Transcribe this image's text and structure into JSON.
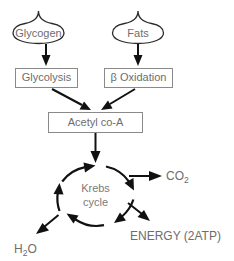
{
  "diagram": {
    "colors": {
      "stroke_dark": "#111111",
      "stroke_blob": "#2b2b2b",
      "box_outline": "#8a8a8a",
      "text_gray": "#6d6d6d",
      "background": "#ffffff"
    },
    "inputs": [
      {
        "id": "glycogen",
        "label": "Glycogen",
        "shape": "flame-blob"
      },
      {
        "id": "fats",
        "label": "Fats",
        "shape": "flame-blob"
      }
    ],
    "processes": [
      {
        "id": "glycolysis",
        "label": "Glycolysis",
        "shape": "rectangle"
      },
      {
        "id": "beta-oxidation",
        "label": "β Oxidation",
        "shape": "rectangle"
      },
      {
        "id": "acetyl-coa",
        "label": "Acetyl co-A",
        "shape": "rectangle"
      }
    ],
    "cycle": {
      "id": "krebs-cycle",
      "label_line1": "Krebs",
      "label_line2": "cycle",
      "shape": "dashed-circular-arrows",
      "segments": 4,
      "direction": "clockwise"
    },
    "outputs": [
      {
        "id": "co2",
        "label_main": "CO",
        "label_sub": "2",
        "position": "right"
      },
      {
        "id": "energy",
        "label_main": "ENERGY (2ATP)",
        "label_sub": "",
        "position": "bottom-right"
      },
      {
        "id": "h2o",
        "label_main_a": "H",
        "label_sub": "2",
        "label_main_b": "O",
        "position": "bottom-left"
      }
    ],
    "edges": [
      {
        "from": "glycogen",
        "to": "glycolysis"
      },
      {
        "from": "fats",
        "to": "beta-oxidation"
      },
      {
        "from": "glycolysis",
        "to": "acetyl-coa"
      },
      {
        "from": "beta-oxidation",
        "to": "acetyl-coa"
      },
      {
        "from": "acetyl-coa",
        "to": "krebs-cycle"
      },
      {
        "from": "krebs-cycle",
        "to": "co2"
      },
      {
        "from": "krebs-cycle",
        "to": "energy"
      },
      {
        "from": "krebs-cycle",
        "to": "h2o"
      }
    ]
  }
}
